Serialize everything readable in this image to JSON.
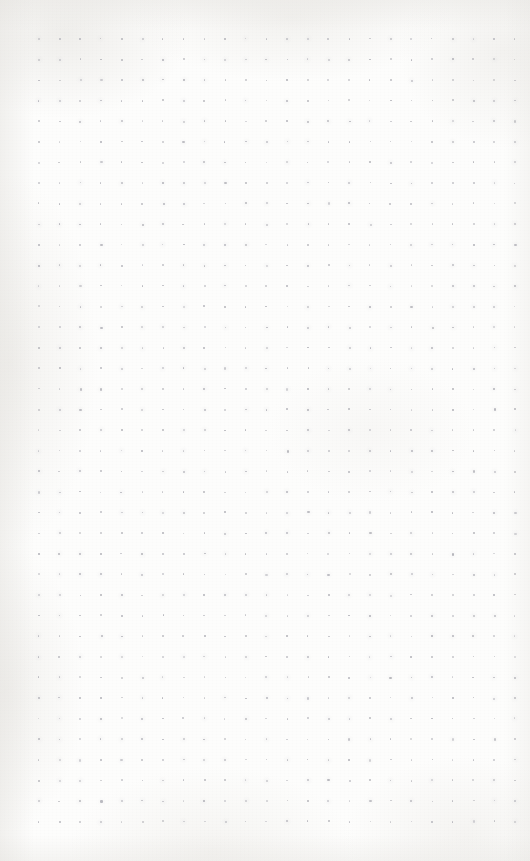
{
  "page": {
    "kind": "dot-grid-paper",
    "width": 530,
    "height": 861,
    "background_color": "#fdfdfc",
    "has_visible_text": false,
    "text_content": ""
  },
  "grid": {
    "dot_color": "#b6b6bc",
    "dot_size_px": 1.6,
    "spacing_x_px": 20.7,
    "spacing_y_px": 20.6,
    "origin_x_px": 38,
    "origin_y_px": 38,
    "columns": 24,
    "rows": 39,
    "margin_left_px": 38,
    "margin_right_px": 18,
    "margin_top_px": 38,
    "margin_bottom_px": 21
  },
  "paper": {
    "texture": "scanned paper grain",
    "vignette_color": "#e2e0dc",
    "tone": "warm off-white"
  }
}
